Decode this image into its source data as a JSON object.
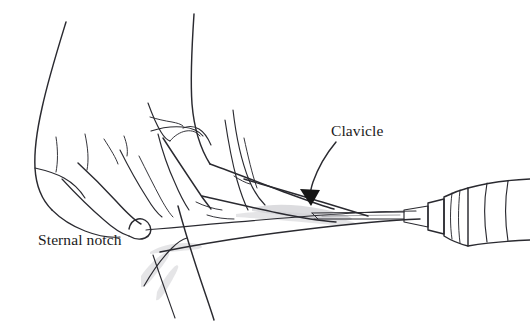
{
  "figure": {
    "background_color": "#ffffff",
    "ink_color": "#2a2a30",
    "width": 530,
    "height": 323
  },
  "annotations": [
    {
      "id": "sternal-notch",
      "label": "Sternal notch",
      "x": 38,
      "y": 245,
      "has_arrowhead": false,
      "description": "Label identifying the suprasternal notch where the fingertip rests"
    },
    {
      "id": "clavicle",
      "label": "Clavicle",
      "x": 331,
      "y": 136,
      "has_arrowhead": true,
      "arrow_target_x": 312,
      "arrow_target_y": 202,
      "description": "Label with curved leader line and filled arrowhead pointing to the clavicle"
    }
  ],
  "elements": {
    "hand": "hand-palpating-sternal-notch",
    "needle": "needle-shaft",
    "syringe": "syringe-barrel-and-hub",
    "neck": "neck-contour",
    "shoulder": "shoulder-contour",
    "chest": "chest-and-sternum-lines",
    "shading": "subclavicular-shading"
  },
  "icons": {
    "arrowhead": "arrowhead-icon"
  }
}
